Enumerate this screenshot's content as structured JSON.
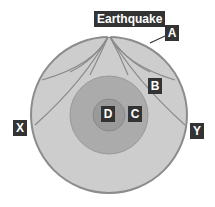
{
  "diagram": {
    "labels": {
      "earthquake": "Earthquake",
      "A": "A",
      "B": "B",
      "C": "C",
      "D": "D",
      "X": "X",
      "Y": "Y"
    },
    "colors": {
      "mantle": "#cdcdcd",
      "crust_edge": "#8c8c8c",
      "outer_core": "#ababab",
      "inner_core": "#9a9a9a",
      "wave_paths": "#8a8a8a",
      "label_bg": "#333333"
    }
  }
}
